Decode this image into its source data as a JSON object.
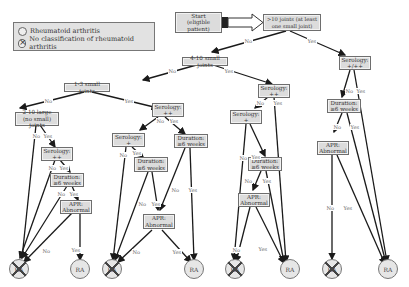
{
  "legend": {
    "items": [
      {
        "icon": "circle-icon",
        "label": "Rheumatoid arthritis"
      },
      {
        "icon": "crossed-circle-icon",
        "label": "No classification of rheumatoid arthritis"
      }
    ]
  },
  "nodes": {
    "start": "Start\n(eligible patient)",
    "gt10": ">10 joints (at least\none small joint)",
    "n4_10": "4-10 small joints",
    "n1_3": "1-3 small joints",
    "n2_10large": "2-10 large\n(no small) joints",
    "col1_sero": "Serology:\n++",
    "col1_dur": "Duration:\n≥6 weeks",
    "col1_apr": "APR:\nAbnormal",
    "col2_sero_pp": "Serology:\n++",
    "col2_sero_p": "Serology:\n+",
    "col2_dur_a": "Duration:\n≥6 weeks",
    "col2_dur_b": "Duration:\n≥6 weeks",
    "col2_apr": "APR:\nAbnormal",
    "col3_sero_pp": "Serology:\n++",
    "col3_sero_p": "Serology:\n+",
    "col3_dur": "Duration:\n≥6 weeks",
    "col3_apr": "APR:\nAbnormal",
    "col4_sero": "Serology:\n+/++",
    "col4_dur": "Duration:\n≥6 weeks",
    "col4_apr": "APR:\nAbnormal"
  },
  "edge_labels": {
    "yes": "Yes",
    "no": "No"
  },
  "outcomes": {
    "ra": "RA",
    "no_ra": "RA"
  },
  "colors": {
    "box_fill": "#dcdcdc",
    "box_border": "#6e6e6e",
    "line": "#1a1a1a",
    "label": "#666666"
  }
}
